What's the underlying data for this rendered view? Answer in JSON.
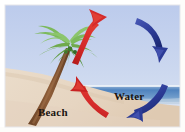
{
  "figure": {
    "kind": "sea-breeze-diagram",
    "width": 185,
    "height": 132,
    "labels": {
      "beach": "Beach",
      "water": "Water"
    },
    "colors": {
      "sky": "#c2d0ee",
      "sky_lower": "#d8e2f2",
      "sand": "#e8d9c8",
      "sand_shadow": "#dbc8b4",
      "water": "#5f8fc4",
      "water_deep": "#3f6fa8",
      "water_foam": "#eef3f8",
      "frond_light": "#8cc06a",
      "frond_mid": "#6faa4c",
      "frond_dark": "#4b8c35",
      "trunk": "#8a5a36",
      "trunk_dark": "#6b4326",
      "arrow_warm": "#cc2222",
      "arrow_warm_dark": "#a31616",
      "arrow_cool": "#2f3f9e",
      "arrow_cool_dark": "#1d2a78",
      "label": "#1a1410",
      "frame": "#ffffff"
    },
    "elements": {
      "palm_tree": "palm-tree",
      "beach_sand": "beach-sand",
      "ocean": "ocean-water",
      "sky": "sky-background",
      "warm_arrow_up": "warm-air-rising-arrow",
      "warm_arrow_inflow": "warm-air-inflow-arrow",
      "cool_arrow_down": "cool-air-descending-arrow",
      "cool_arrow_outflow": "cool-air-outflow-arrow"
    }
  }
}
